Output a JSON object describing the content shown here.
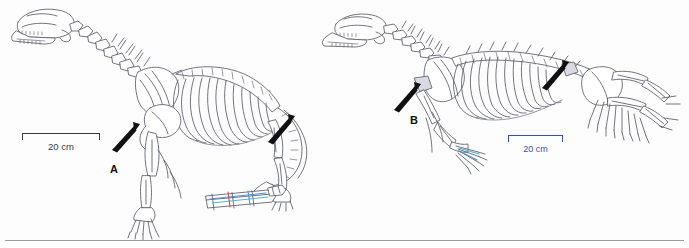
{
  "figure": {
    "type": "scientific-illustration",
    "background_color": "#fdfdfd",
    "line_color": "#555566",
    "panels": [
      {
        "id": "A",
        "label": "A",
        "description": "Skeleton in crouched terrestrial stance, facing left, with elongated neck, skull with open jaw, arched ribcage, hind limb with digits, long tapering tail, and a detached colored manus/pes element at lower right",
        "arrow_count": 2,
        "highlight_colors": [
          "#5a8fd6",
          "#49b9c4",
          "#d04a4a"
        ],
        "scalebar": {
          "label": "20 cm",
          "color": "#3b3b4a"
        }
      },
      {
        "id": "B",
        "label": "B",
        "description": "Skeleton in low sprawling semi-aquatic stance, facing left, with skull held low, long vertebral column, broad ribcage, splayed forelimb and enlarged webbed hind limb extending right",
        "arrow_count": 2,
        "highlight_colors": [
          "#5a8fd6",
          "#49b9c4"
        ],
        "scalebar": {
          "label": "20 cm",
          "color": "#3b4fa6"
        }
      }
    ],
    "annotations": {
      "arrows": [
        {
          "panel": "A",
          "x": 128,
          "y": 132,
          "angle": -42,
          "name": "arrow-a-pelvis"
        },
        {
          "panel": "A",
          "x": 283,
          "y": 124,
          "angle": -42,
          "name": "arrow-a-tail-base"
        },
        {
          "panel": "B",
          "x": 409,
          "y": 92,
          "angle": -42,
          "name": "arrow-b-shoulder"
        },
        {
          "panel": "B",
          "x": 556,
          "y": 70,
          "angle": -42,
          "name": "arrow-b-hindlimb"
        }
      ]
    },
    "footer_rule": {
      "color": "#9a9aa2"
    }
  }
}
